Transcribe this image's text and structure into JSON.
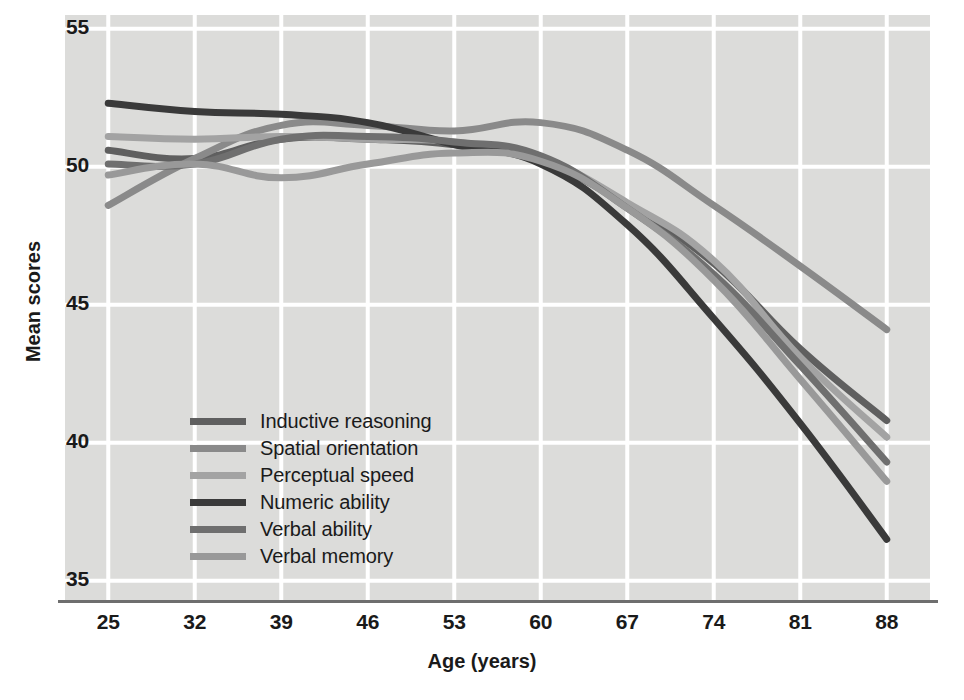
{
  "chart_data": {
    "type": "line",
    "title": "",
    "xlabel": "Age (years)",
    "ylabel": "Mean scores",
    "x": [
      25,
      32,
      39,
      46,
      53,
      60,
      67,
      74,
      81,
      88
    ],
    "xticks": [
      "25",
      "32",
      "39",
      "46",
      "53",
      "60",
      "67",
      "74",
      "81",
      "88"
    ],
    "yticks": [
      "55",
      "50",
      "45",
      "40",
      "35"
    ],
    "ytickvals": [
      55,
      50,
      45,
      40,
      35
    ],
    "xlim": [
      21.5,
      91.5
    ],
    "ylim": [
      34.3,
      55.5
    ],
    "grid": true,
    "legend_position": "center-left",
    "series": [
      {
        "name": "Inductive reasoning",
        "color": "#5f5f5f",
        "values": [
          50.6,
          50.3,
          51.0,
          51.0,
          50.8,
          50.2,
          48.6,
          46.5,
          43.4,
          40.8
        ]
      },
      {
        "name": "Spatial orientation",
        "color": "#8a8a8a",
        "values": [
          48.6,
          50.3,
          51.5,
          51.5,
          51.3,
          51.6,
          50.6,
          48.6,
          46.4,
          44.1
        ]
      },
      {
        "name": "Perceptual speed",
        "color": "#a3a3a3",
        "values": [
          51.1,
          51.0,
          51.1,
          51.0,
          50.9,
          50.3,
          48.7,
          46.6,
          43.1,
          40.2
        ]
      },
      {
        "name": "Numeric ability",
        "color": "#3a3a3a",
        "values": [
          52.3,
          52.0,
          51.9,
          51.6,
          50.8,
          50.1,
          47.9,
          44.5,
          40.7,
          36.5
        ]
      },
      {
        "name": "Verbal ability",
        "color": "#6f6f6f",
        "values": [
          50.1,
          50.1,
          51.0,
          51.1,
          50.9,
          50.4,
          48.5,
          46.1,
          42.8,
          39.3
        ]
      },
      {
        "name": "Verbal memory",
        "color": "#999999",
        "values": [
          49.7,
          50.1,
          49.6,
          50.1,
          50.5,
          50.2,
          48.5,
          45.9,
          42.3,
          38.6
        ]
      }
    ]
  },
  "background": {
    "plot_fill": "#dcdcda",
    "grid_color": "#ffffff",
    "page_fill": "#ffffff",
    "axis_color": "#6e6e6e"
  },
  "bleed_text": [
    "MEMORY AND INTELLIGENCE",
    "We have seen that intelligence and adults' ways of thinking",
    "change in early adulthood. Many of the same trends continue",
    "later and throughout life.",
    "skills as the older adult ages, and they can change slowly over",
    "hours. In a lower-level lexical sphere in possession of a wider",
    "that has been shown to improve information processing",
    "Memory",
    "Important changes of memory that occur in middle adulthood and theories",
    "and life changes of fluid and crystallized intelligence.",
    "Fluid and Crystallized Intelligence",
    "open to floor reports that some abilities decline in the middle years, while"
  ]
}
